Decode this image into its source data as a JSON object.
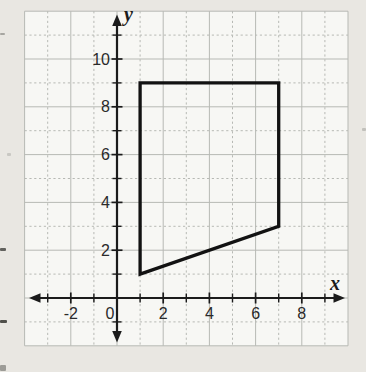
{
  "figure": {
    "bg_color": "#e9e7e2",
    "panel_color": "#f7f7f4",
    "grid_color": "#b7b9b4",
    "axis_color": "#1b1b1b",
    "tick_label_color": "#2a2a2a",
    "shape_color": "#121212"
  },
  "chart_data": {
    "type": "line",
    "title": "",
    "xlabel": "x",
    "ylabel": "y",
    "xlim": [
      -4,
      10
    ],
    "ylim": [
      -2,
      12
    ],
    "grid": true,
    "tick_step": 1,
    "x_tick_labels": [
      "-2",
      "0",
      "2",
      "4",
      "6",
      "8"
    ],
    "x_tick_label_values": [
      -2,
      0,
      2,
      4,
      6,
      8
    ],
    "y_tick_labels": [
      "2",
      "4",
      "6",
      "8",
      "10"
    ],
    "y_tick_label_values": [
      2,
      4,
      6,
      8,
      10
    ],
    "series": [
      {
        "name": "quadrilateral",
        "closed": true,
        "points": [
          [
            1,
            1
          ],
          [
            1,
            9
          ],
          [
            7,
            9
          ],
          [
            7,
            3
          ]
        ]
      }
    ]
  },
  "artifacts": [
    {
      "x": 0,
      "y": 33,
      "w": 5,
      "h": 2,
      "color": "#8a8a86",
      "opacity": 0.7
    },
    {
      "x": 7,
      "y": 153,
      "w": 4,
      "h": 3,
      "color": "#a9a9a4",
      "opacity": 0.5
    },
    {
      "x": 0,
      "y": 248,
      "w": 6,
      "h": 3,
      "color": "#4a4a46",
      "opacity": 0.85
    },
    {
      "x": 0,
      "y": 320,
      "w": 7,
      "h": 3,
      "color": "#3f3f3b",
      "opacity": 0.9
    },
    {
      "x": 0,
      "y": 365,
      "w": 6,
      "h": 6,
      "color": "#6a6a66",
      "opacity": 0.6
    },
    {
      "x": 362,
      "y": 128,
      "w": 4,
      "h": 3,
      "color": "#9b9b96",
      "opacity": 0.5
    }
  ]
}
